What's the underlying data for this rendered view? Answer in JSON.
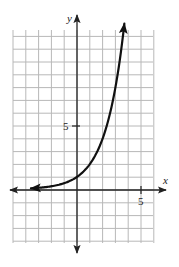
{
  "chart_data": {
    "type": "line",
    "title": "",
    "xlabel": "x",
    "ylabel": "y",
    "xlim": [
      -5,
      6
    ],
    "ylim": [
      -4,
      12.5
    ],
    "grid": true,
    "grid_step": 1,
    "x_ticks": [
      {
        "value": 5,
        "label": "5"
      }
    ],
    "y_ticks": [
      {
        "value": 5,
        "label": "5"
      }
    ],
    "series": [
      {
        "name": "curve",
        "function": "y = 2^x (exponential growth)",
        "x": [
          -3.6,
          -3,
          -2,
          -1,
          0,
          1,
          2,
          3,
          3.7
        ],
        "y": [
          0.08,
          0.125,
          0.25,
          0.5,
          1,
          2,
          4,
          8,
          12.1
        ],
        "arrow_both_ends": true
      }
    ]
  },
  "axes": {
    "x_label": "x",
    "y_label": "y",
    "x_tick_label": "5",
    "y_tick_label": "5"
  },
  "colors": {
    "grid": "#b8b8b8",
    "axis": "#222222",
    "curve": "#111111"
  }
}
